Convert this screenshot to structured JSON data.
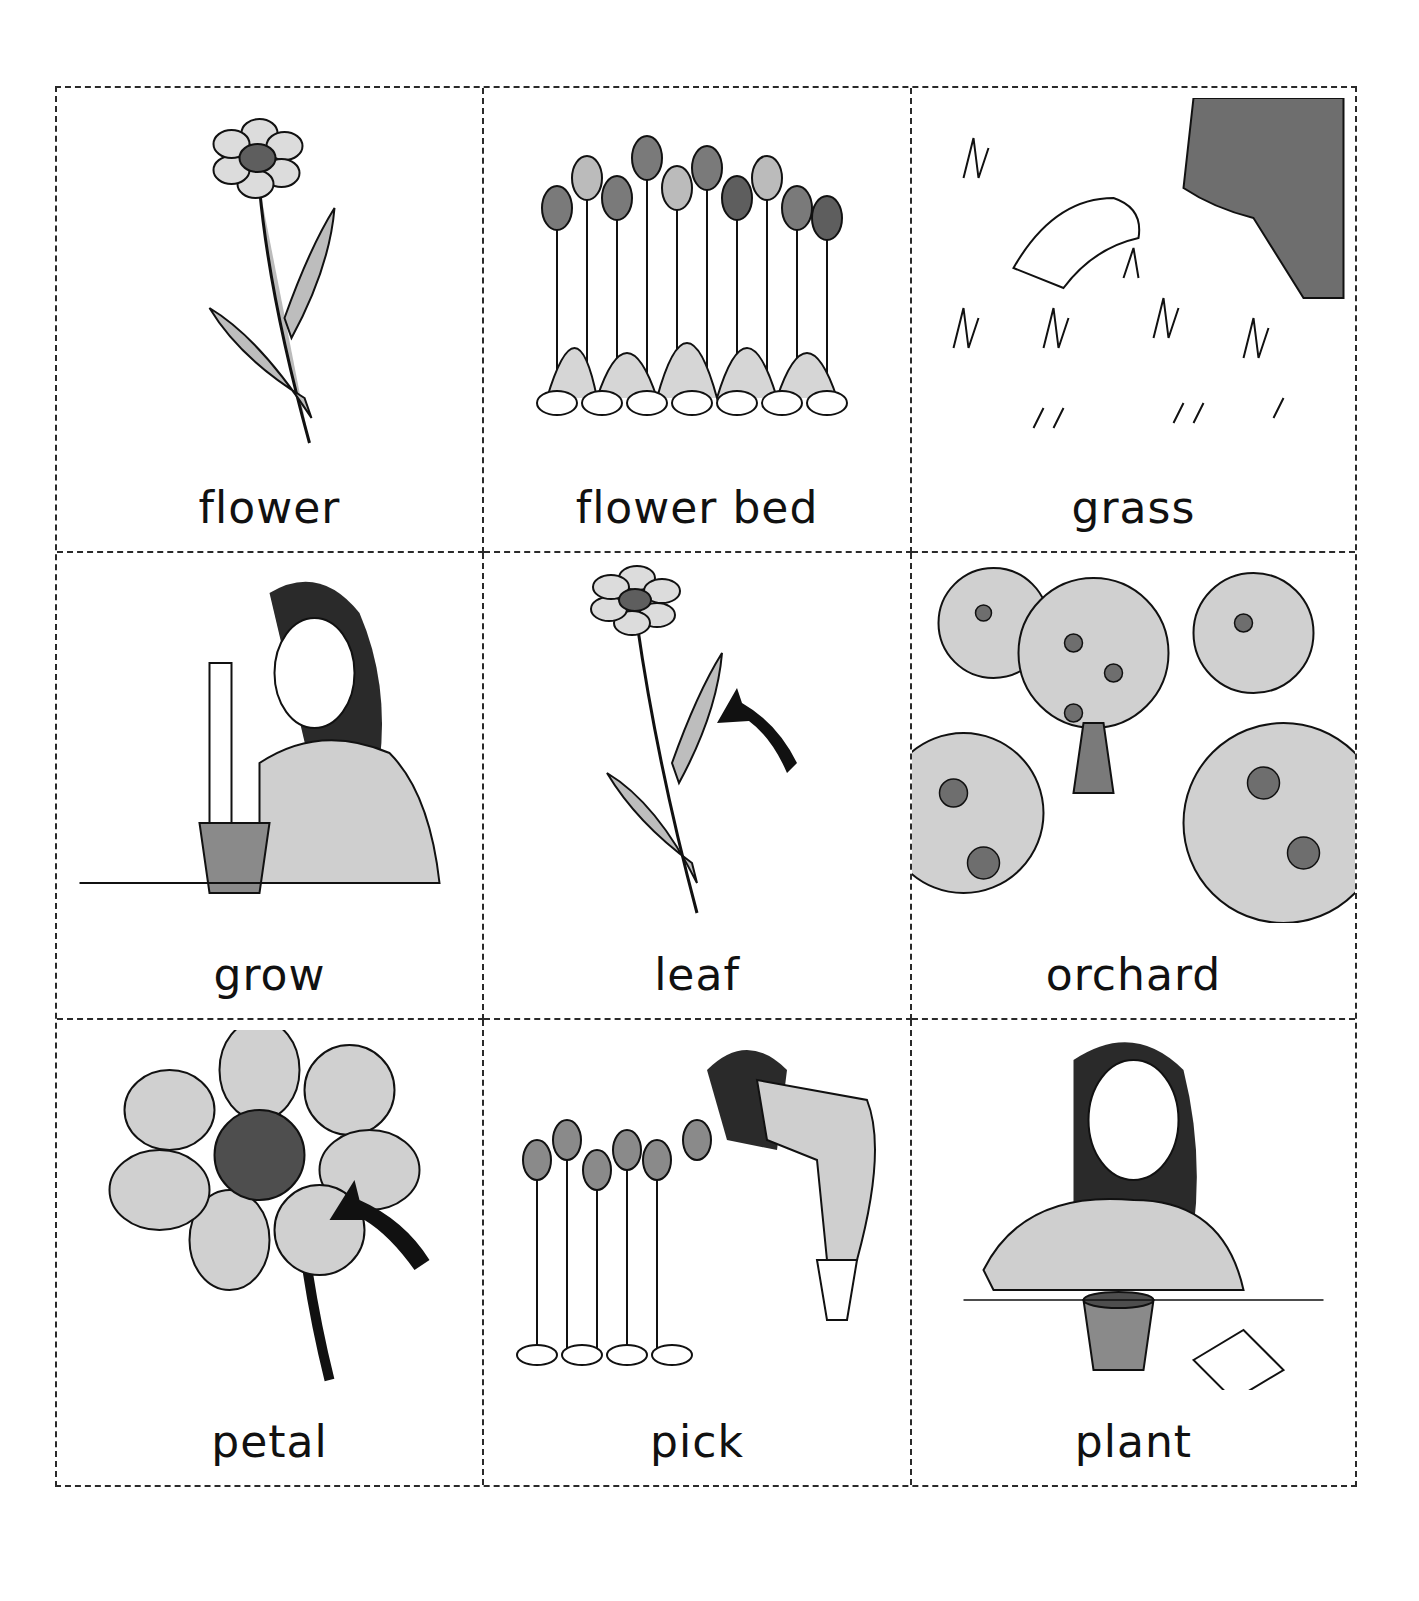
{
  "cards": [
    {
      "label": "flower",
      "icon": "flower-icon"
    },
    {
      "label": "flower bed",
      "icon": "flower-bed-icon"
    },
    {
      "label": "grass",
      "icon": "grass-icon"
    },
    {
      "label": "grow",
      "icon": "girl-measuring-plant-icon"
    },
    {
      "label": "leaf",
      "icon": "leaf-with-arrow-icon"
    },
    {
      "label": "orchard",
      "icon": "orchard-icon"
    },
    {
      "label": "petal",
      "icon": "petal-with-arrow-icon"
    },
    {
      "label": "pick",
      "icon": "girl-picking-tulips-icon"
    },
    {
      "label": "plant",
      "icon": "girl-planting-seed-icon"
    }
  ],
  "colors": {
    "border": "#2a2a2a",
    "fill_light": "#cfcfcf",
    "fill_mid": "#9a9a9a",
    "fill_dark": "#5e5e5e",
    "ink": "#111111"
  }
}
